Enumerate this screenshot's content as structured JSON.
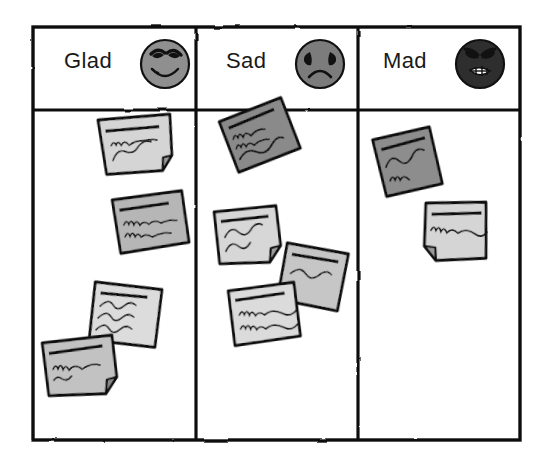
{
  "board": {
    "title": "Glad Sad Mad retrospective board",
    "style": "hand-drawn sketch, grayscale",
    "frame": {
      "x": 33,
      "y": 27,
      "width": 487,
      "height": 413,
      "stroke": "#111111",
      "fill": "#ffffff"
    },
    "header_row_height": 83,
    "column_dividers_x": [
      196,
      358
    ]
  },
  "columns": [
    {
      "id": "glad",
      "label": "Glad",
      "icon": "smiley-happy-face-icon",
      "icon_fill": "#8f8f8f",
      "icon_stroke": "#111111",
      "note_count": 4,
      "notes": [
        {
          "id": "glad-note-1",
          "x": 98,
          "y": 120,
          "w": 72,
          "h": 58,
          "rot": -7,
          "fill": "#d5d5d5",
          "folded_corner": true,
          "lines": 2
        },
        {
          "id": "glad-note-2",
          "x": 112,
          "y": 198,
          "w": 70,
          "h": 56,
          "rot": -6,
          "fill": "#b6b6b6",
          "folded_corner": false,
          "lines": 2
        },
        {
          "id": "glad-note-3",
          "x": 96,
          "y": 278,
          "w": 68,
          "h": 62,
          "rot": 10,
          "fill": "#dcdcdc",
          "folded_corner": false,
          "lines": 3
        },
        {
          "id": "glad-note-4",
          "x": 42,
          "y": 340,
          "w": 70,
          "h": 58,
          "rot": -4,
          "fill": "#c2c2c2",
          "folded_corner": true,
          "lines": 2
        }
      ]
    },
    {
      "id": "sad",
      "label": "Sad",
      "icon": "sad-frowning-face-icon",
      "icon_fill": "#7c7c7c",
      "icon_stroke": "#111111",
      "note_count": 4,
      "notes": [
        {
          "id": "sad-note-1",
          "x": 218,
          "y": 118,
          "w": 66,
          "h": 58,
          "rot": -18,
          "fill": "#8a8a8a",
          "folded_corner": false,
          "lines": 3
        },
        {
          "id": "sad-note-2",
          "x": 214,
          "y": 210,
          "w": 62,
          "h": 56,
          "rot": -4,
          "fill": "#d7d7d7",
          "folded_corner": true,
          "lines": 2
        },
        {
          "id": "sad-note-3",
          "x": 288,
          "y": 240,
          "w": 62,
          "h": 60,
          "rot": 13,
          "fill": "#c6c6c6",
          "folded_corner": false,
          "lines": 1
        },
        {
          "id": "sad-note-4",
          "x": 228,
          "y": 288,
          "w": 66,
          "h": 58,
          "rot": -5,
          "fill": "#dbdbdb",
          "folded_corner": false,
          "lines": 2
        }
      ]
    },
    {
      "id": "mad",
      "label": "Mad",
      "icon": "angry-face-icon",
      "icon_fill": "#2e2e2e",
      "icon_stroke": "#111111",
      "note_count": 2,
      "notes": [
        {
          "id": "mad-note-1",
          "x": 372,
          "y": 136,
          "w": 58,
          "h": 62,
          "rot": -9,
          "fill": "#8d8d8d",
          "folded_corner": false,
          "lines": 2
        },
        {
          "id": "mad-note-2",
          "x": 424,
          "y": 200,
          "w": 62,
          "h": 60,
          "rot": 2,
          "fill": "#d5d5d5",
          "folded_corner": true,
          "lines": 1
        }
      ]
    }
  ],
  "icons": {
    "happy": {
      "cx": 165,
      "cy": 64,
      "r": 24
    },
    "sad": {
      "cx": 320,
      "cy": 64,
      "r": 24
    },
    "mad": {
      "cx": 480,
      "cy": 64,
      "r": 24
    }
  },
  "colors": {
    "ink": "#111111",
    "paper": "#ffffff",
    "note_light": "#dcdcdc",
    "note_mid": "#c2c2c2",
    "note_dark": "#8a8a8a",
    "face_happy": "#8f8f8f",
    "face_sad": "#7c7c7c",
    "face_mad": "#2e2e2e"
  }
}
